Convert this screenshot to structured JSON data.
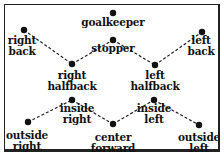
{
  "diagram": {
    "nodes": [
      {
        "id": "goalkeeper",
        "label": "goalkeeper",
        "x": 113,
        "y": 13,
        "lx": 113,
        "ly": 17
      },
      {
        "id": "right-back",
        "label": "right\nback",
        "x": 24,
        "y": 30,
        "lx": 22,
        "ly": 35
      },
      {
        "id": "stopper",
        "label": "stopper",
        "x": 113,
        "y": 40,
        "lx": 113,
        "ly": 43
      },
      {
        "id": "left-back",
        "label": "left\nback",
        "x": 202,
        "y": 32,
        "lx": 201,
        "ly": 35
      },
      {
        "id": "right-halfback",
        "label": "right\nhalfback",
        "x": 72,
        "y": 64,
        "lx": 72,
        "ly": 70
      },
      {
        "id": "left-halfback",
        "label": "left\nhalfback",
        "x": 155,
        "y": 65,
        "lx": 155,
        "ly": 70
      },
      {
        "id": "inside-right",
        "label": "inside\nright",
        "x": 72,
        "y": 100,
        "lx": 77,
        "ly": 103
      },
      {
        "id": "inside-left",
        "label": "inside\nleft",
        "x": 154,
        "y": 100,
        "lx": 154,
        "ly": 103
      },
      {
        "id": "outside-right",
        "label": "outside\nright",
        "x": 28,
        "y": 122,
        "lx": 27,
        "ly": 130
      },
      {
        "id": "center-forward",
        "label": "center\nforward",
        "x": 113,
        "y": 124,
        "lx": 113,
        "ly": 132
      },
      {
        "id": "outside-left",
        "label": "outside\nleft",
        "x": 199,
        "y": 125,
        "lx": 199,
        "ly": 132
      }
    ],
    "edges": [
      [
        "right-back",
        "right-halfback"
      ],
      [
        "right-halfback",
        "stopper"
      ],
      [
        "stopper",
        "left-halfback"
      ],
      [
        "left-halfback",
        "left-back"
      ],
      [
        "outside-right",
        "inside-right"
      ],
      [
        "inside-right",
        "center-forward"
      ],
      [
        "center-forward",
        "inside-left"
      ],
      [
        "inside-left",
        "outside-left"
      ]
    ]
  }
}
